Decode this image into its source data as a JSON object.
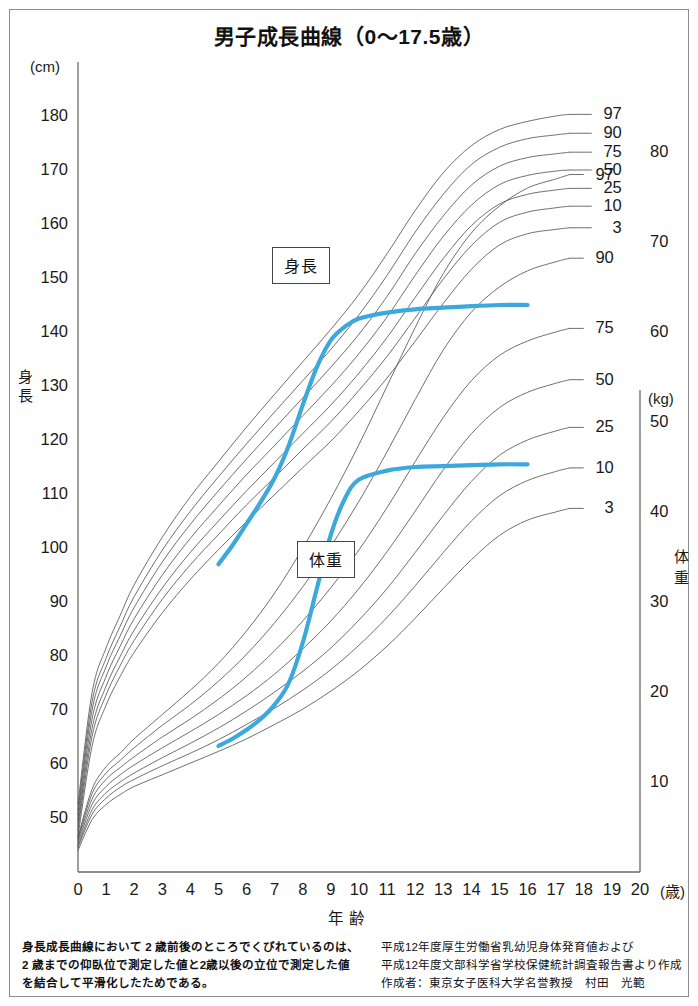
{
  "title": "男子成長曲線（0〜17.5歳）",
  "axes": {
    "left_unit": "(cm)",
    "right_unit": "(kg)",
    "left_caption_chars": [
      "身",
      "長"
    ],
    "right_caption_chars": [
      "体",
      "重"
    ],
    "x_title": "年齢",
    "x_unit": "(歳)",
    "left_ticks": [
      "180",
      "170",
      "160",
      "150",
      "140",
      "130",
      "120",
      "110",
      "100",
      "90",
      "80",
      "70",
      "60",
      "50"
    ],
    "right_ticks": [
      "80",
      "70",
      "60",
      "50",
      "40",
      "30",
      "20",
      "10"
    ],
    "x_ticks": [
      "0",
      "1",
      "2",
      "3",
      "4",
      "5",
      "6",
      "7",
      "8",
      "9",
      "10",
      "11",
      "12",
      "13",
      "14",
      "15",
      "16",
      "17",
      "18",
      "19",
      "20"
    ]
  },
  "series_labels": {
    "height": "身長",
    "weight": "体重"
  },
  "percentile_labels": [
    "97",
    "90",
    "75",
    "50",
    "25",
    "10",
    "3"
  ],
  "colors": {
    "patient_curve": "#3da8dc",
    "percentile_curve": "#555555",
    "frame": "#8d8d8d",
    "text": "#1a1a1a"
  },
  "footnotes": {
    "left": [
      "身長成長曲線において 2 歳前後のところでくびれているのは、",
      "2 歳までの仰臥位で測定した値と2歳以後の立位で測定した値",
      "を結合して平滑化したためである。"
    ],
    "right": [
      "平成12年度厚生労働省乳幼児身体発育値および",
      "平成12年度文部科学省学校保健統計調査報告書より作成",
      "作成者：東京女子医科大学名誉教授　村田　光範"
    ]
  },
  "chart_data": {
    "type": "line",
    "title": "男子成長曲線（0〜17.5歳）",
    "xlabel": "年齢 (歳)",
    "ylabel": "身長 (cm) / 体重 (kg)",
    "xlim": [
      0,
      20
    ],
    "height_ylim": [
      40,
      190
    ],
    "weight_ylim": [
      0,
      90
    ],
    "grid": false,
    "legend": "inline-right-of-curves",
    "x": [
      0,
      0.5,
      1,
      1.5,
      2,
      3,
      4,
      5,
      6,
      7,
      8,
      9,
      10,
      11,
      12,
      13,
      14,
      15,
      16,
      17,
      17.5
    ],
    "height_series": [
      {
        "name": "97",
        "values": [
          52.6,
          73.2,
          81.5,
          87.5,
          93.2,
          102.0,
          109.5,
          116.0,
          122.4,
          128.5,
          134.5,
          140.5,
          147.0,
          154.5,
          162.5,
          169.5,
          174.5,
          177.5,
          179.0,
          180.0,
          180.3
        ]
      },
      {
        "name": "90",
        "values": [
          51.5,
          71.5,
          79.6,
          85.5,
          91.0,
          99.6,
          106.8,
          113.2,
          119.3,
          125.2,
          131.0,
          136.8,
          143.2,
          150.5,
          158.5,
          165.5,
          171.0,
          174.2,
          175.8,
          176.5,
          176.8
        ]
      },
      {
        "name": "75",
        "values": [
          50.6,
          70.0,
          78.0,
          83.7,
          89.0,
          97.4,
          104.4,
          110.6,
          116.5,
          122.2,
          127.8,
          133.5,
          139.6,
          146.6,
          154.5,
          161.5,
          167.2,
          170.7,
          172.3,
          173.0,
          173.3
        ]
      },
      {
        "name": "50",
        "values": [
          49.6,
          68.3,
          76.2,
          81.8,
          86.9,
          95.0,
          101.8,
          107.8,
          113.6,
          119.0,
          124.5,
          130.0,
          136.0,
          142.8,
          150.5,
          157.7,
          163.5,
          167.3,
          169.0,
          169.8,
          170.0
        ]
      },
      {
        "name": "25",
        "values": [
          48.6,
          66.6,
          74.4,
          79.9,
          84.8,
          92.6,
          99.2,
          105.0,
          110.6,
          115.9,
          121.2,
          126.5,
          132.4,
          139.0,
          146.4,
          153.6,
          159.7,
          163.7,
          165.5,
          166.3,
          166.6
        ]
      },
      {
        "name": "10",
        "values": [
          47.7,
          65.1,
          72.8,
          78.2,
          82.9,
          90.5,
          96.9,
          102.5,
          108.0,
          113.1,
          118.3,
          123.4,
          129.2,
          135.5,
          142.6,
          149.8,
          156.0,
          160.3,
          162.2,
          163.0,
          163.3
        ]
      },
      {
        "name": "3",
        "values": [
          46.6,
          63.3,
          70.9,
          76.2,
          80.7,
          88.0,
          94.2,
          99.7,
          104.9,
          109.9,
          114.9,
          119.8,
          125.4,
          131.5,
          138.3,
          145.3,
          151.6,
          156.1,
          158.2,
          159.0,
          159.3
        ]
      }
    ],
    "weight_series": [
      {
        "name": "97",
        "values": [
          3.9,
          9.2,
          11.7,
          13.2,
          14.8,
          17.5,
          20.2,
          23.2,
          26.8,
          31.0,
          36.0,
          41.5,
          47.5,
          54.0,
          60.5,
          66.5,
          71.0,
          74.0,
          76.0,
          77.0,
          77.5
        ]
      },
      {
        "name": "90",
        "values": [
          3.7,
          8.7,
          11.0,
          12.4,
          13.8,
          16.3,
          18.6,
          21.2,
          24.2,
          27.7,
          31.7,
          36.2,
          41.2,
          46.7,
          52.5,
          58.0,
          62.2,
          65.0,
          66.8,
          67.8,
          68.2
        ]
      },
      {
        "name": "75",
        "values": [
          3.5,
          8.1,
          10.3,
          11.6,
          12.8,
          15.0,
          17.0,
          19.2,
          21.7,
          24.6,
          27.9,
          31.6,
          35.8,
          40.5,
          45.6,
          50.5,
          54.6,
          57.4,
          59.0,
          60.0,
          60.4
        ]
      },
      {
        "name": "50",
        "values": [
          3.2,
          7.5,
          9.5,
          10.8,
          11.9,
          13.8,
          15.6,
          17.5,
          19.6,
          22.0,
          24.8,
          27.9,
          31.5,
          35.6,
          40.1,
          44.7,
          48.7,
          51.6,
          53.3,
          54.3,
          54.7
        ]
      },
      {
        "name": "25",
        "values": [
          2.9,
          6.9,
          8.8,
          10.0,
          11.0,
          12.7,
          14.3,
          16.0,
          17.9,
          20.0,
          22.3,
          24.9,
          28.0,
          31.5,
          35.5,
          39.6,
          43.4,
          46.3,
          48.0,
          49.0,
          49.4
        ]
      },
      {
        "name": "10",
        "values": [
          2.7,
          6.4,
          8.2,
          9.4,
          10.3,
          11.8,
          13.2,
          14.7,
          16.4,
          18.2,
          20.2,
          22.5,
          25.2,
          28.3,
          31.8,
          35.5,
          39.0,
          41.8,
          43.5,
          44.5,
          44.9
        ]
      },
      {
        "name": "3",
        "values": [
          2.4,
          5.8,
          7.5,
          8.6,
          9.5,
          10.8,
          12.1,
          13.4,
          14.8,
          16.4,
          18.1,
          20.1,
          22.4,
          25.1,
          28.2,
          31.5,
          34.7,
          37.4,
          39.1,
          40.0,
          40.4
        ]
      }
    ],
    "patient": {
      "height_curve": {
        "name": "患者身長",
        "x": [
          5.0,
          5.5,
          6.0,
          6.5,
          7.0,
          7.5,
          8.0,
          8.5,
          9.0,
          9.5,
          10.0,
          11.0,
          12.0,
          13.0,
          14.0,
          15.0,
          16.0
        ],
        "values": [
          97.0,
          100.5,
          104.5,
          108.5,
          113.0,
          119.0,
          126.5,
          133.5,
          138.5,
          141.0,
          142.5,
          143.6,
          144.2,
          144.5,
          144.8,
          145.0,
          145.0
        ]
      },
      "weight_curve": {
        "name": "患者体重",
        "x": [
          5.0,
          5.5,
          6.0,
          6.5,
          7.0,
          7.5,
          8.0,
          8.5,
          9.0,
          9.5,
          10.0,
          11.0,
          12.0,
          13.0,
          14.0,
          15.0,
          16.0
        ],
        "values": [
          14.0,
          14.8,
          15.8,
          17.0,
          18.6,
          21.0,
          25.5,
          31.5,
          37.5,
          41.5,
          43.6,
          44.6,
          45.0,
          45.1,
          45.2,
          45.3,
          45.3
        ]
      }
    }
  }
}
